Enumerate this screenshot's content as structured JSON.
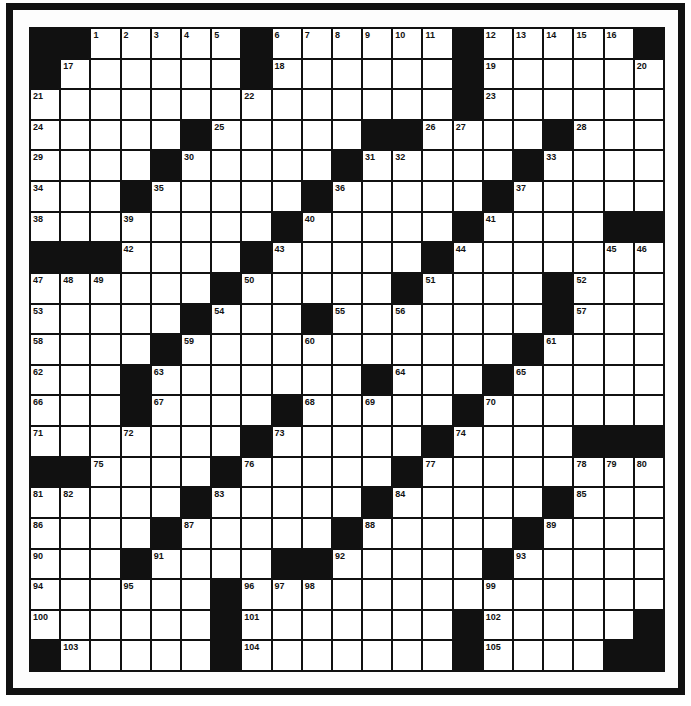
{
  "puzzle": {
    "rows": 21,
    "cols": 21,
    "colors": {
      "black": "#111111",
      "white": "#ffffff",
      "line": "#111111"
    },
    "black_cells": [
      [
        0,
        1,
        7,
        14,
        20
      ],
      [
        0,
        7,
        14
      ],
      [
        14
      ],
      [
        5,
        11,
        12,
        17
      ],
      [
        4,
        10,
        16
      ],
      [
        3,
        9,
        15
      ],
      [
        8,
        14,
        19,
        20
      ],
      [
        0,
        1,
        2,
        7,
        13
      ],
      [
        6,
        12,
        17
      ],
      [
        5,
        9,
        17
      ],
      [
        4,
        16
      ],
      [
        3,
        11,
        15
      ],
      [
        3,
        8,
        14
      ],
      [
        7,
        13,
        18,
        19,
        20
      ],
      [
        0,
        1,
        6,
        12
      ],
      [
        5,
        11,
        17
      ],
      [
        4,
        10,
        16
      ],
      [
        3,
        8,
        9,
        15
      ],
      [
        6
      ],
      [
        6,
        14,
        20
      ],
      [
        0,
        6,
        14,
        19,
        20
      ]
    ],
    "numbers": [
      {
        "r": 0,
        "c": 2,
        "n": "1"
      },
      {
        "r": 0,
        "c": 3,
        "n": "2"
      },
      {
        "r": 0,
        "c": 4,
        "n": "3"
      },
      {
        "r": 0,
        "c": 5,
        "n": "4"
      },
      {
        "r": 0,
        "c": 6,
        "n": "5"
      },
      {
        "r": 0,
        "c": 8,
        "n": "6"
      },
      {
        "r": 0,
        "c": 9,
        "n": "7"
      },
      {
        "r": 0,
        "c": 10,
        "n": "8"
      },
      {
        "r": 0,
        "c": 11,
        "n": "9"
      },
      {
        "r": 0,
        "c": 12,
        "n": "10"
      },
      {
        "r": 0,
        "c": 13,
        "n": "11"
      },
      {
        "r": 0,
        "c": 15,
        "n": "12"
      },
      {
        "r": 0,
        "c": 16,
        "n": "13"
      },
      {
        "r": 0,
        "c": 17,
        "n": "14"
      },
      {
        "r": 0,
        "c": 18,
        "n": "15"
      },
      {
        "r": 0,
        "c": 19,
        "n": "16"
      },
      {
        "r": 1,
        "c": 1,
        "n": "17"
      },
      {
        "r": 1,
        "c": 8,
        "n": "18"
      },
      {
        "r": 1,
        "c": 15,
        "n": "19"
      },
      {
        "r": 1,
        "c": 20,
        "n": "20"
      },
      {
        "r": 2,
        "c": 0,
        "n": "21"
      },
      {
        "r": 2,
        "c": 7,
        "n": "22"
      },
      {
        "r": 2,
        "c": 15,
        "n": "23"
      },
      {
        "r": 3,
        "c": 0,
        "n": "24"
      },
      {
        "r": 3,
        "c": 6,
        "n": "25"
      },
      {
        "r": 3,
        "c": 13,
        "n": "26"
      },
      {
        "r": 3,
        "c": 14,
        "n": "27"
      },
      {
        "r": 3,
        "c": 18,
        "n": "28"
      },
      {
        "r": 4,
        "c": 0,
        "n": "29"
      },
      {
        "r": 4,
        "c": 5,
        "n": "30"
      },
      {
        "r": 4,
        "c": 11,
        "n": "31"
      },
      {
        "r": 4,
        "c": 12,
        "n": "32"
      },
      {
        "r": 4,
        "c": 17,
        "n": "33"
      },
      {
        "r": 5,
        "c": 0,
        "n": "34"
      },
      {
        "r": 5,
        "c": 4,
        "n": "35"
      },
      {
        "r": 5,
        "c": 10,
        "n": "36"
      },
      {
        "r": 5,
        "c": 16,
        "n": "37"
      },
      {
        "r": 6,
        "c": 0,
        "n": "38"
      },
      {
        "r": 6,
        "c": 3,
        "n": "39"
      },
      {
        "r": 6,
        "c": 9,
        "n": "40"
      },
      {
        "r": 6,
        "c": 15,
        "n": "41"
      },
      {
        "r": 7,
        "c": 3,
        "n": "42"
      },
      {
        "r": 7,
        "c": 8,
        "n": "43"
      },
      {
        "r": 7,
        "c": 14,
        "n": "44"
      },
      {
        "r": 7,
        "c": 19,
        "n": "45"
      },
      {
        "r": 7,
        "c": 20,
        "n": "46"
      },
      {
        "r": 8,
        "c": 0,
        "n": "47"
      },
      {
        "r": 8,
        "c": 1,
        "n": "48"
      },
      {
        "r": 8,
        "c": 2,
        "n": "49"
      },
      {
        "r": 8,
        "c": 7,
        "n": "50"
      },
      {
        "r": 8,
        "c": 13,
        "n": "51"
      },
      {
        "r": 8,
        "c": 18,
        "n": "52"
      },
      {
        "r": 9,
        "c": 0,
        "n": "53"
      },
      {
        "r": 9,
        "c": 6,
        "n": "54"
      },
      {
        "r": 9,
        "c": 10,
        "n": "55"
      },
      {
        "r": 9,
        "c": 12,
        "n": "56"
      },
      {
        "r": 9,
        "c": 18,
        "n": "57"
      },
      {
        "r": 10,
        "c": 0,
        "n": "58"
      },
      {
        "r": 10,
        "c": 5,
        "n": "59"
      },
      {
        "r": 10,
        "c": 9,
        "n": "60"
      },
      {
        "r": 10,
        "c": 17,
        "n": "61"
      },
      {
        "r": 11,
        "c": 0,
        "n": "62"
      },
      {
        "r": 11,
        "c": 4,
        "n": "63"
      },
      {
        "r": 11,
        "c": 12,
        "n": "64"
      },
      {
        "r": 11,
        "c": 16,
        "n": "65"
      },
      {
        "r": 12,
        "c": 0,
        "n": "66"
      },
      {
        "r": 12,
        "c": 4,
        "n": "67"
      },
      {
        "r": 12,
        "c": 9,
        "n": "68"
      },
      {
        "r": 12,
        "c": 11,
        "n": "69"
      },
      {
        "r": 12,
        "c": 15,
        "n": "70"
      },
      {
        "r": 13,
        "c": 0,
        "n": "71"
      },
      {
        "r": 13,
        "c": 3,
        "n": "72"
      },
      {
        "r": 13,
        "c": 8,
        "n": "73"
      },
      {
        "r": 13,
        "c": 14,
        "n": "74"
      },
      {
        "r": 14,
        "c": 2,
        "n": "75"
      },
      {
        "r": 14,
        "c": 7,
        "n": "76"
      },
      {
        "r": 14,
        "c": 13,
        "n": "77"
      },
      {
        "r": 14,
        "c": 18,
        "n": "78"
      },
      {
        "r": 14,
        "c": 19,
        "n": "79"
      },
      {
        "r": 14,
        "c": 20,
        "n": "80"
      },
      {
        "r": 15,
        "c": 0,
        "n": "81"
      },
      {
        "r": 15,
        "c": 1,
        "n": "82"
      },
      {
        "r": 15,
        "c": 6,
        "n": "83"
      },
      {
        "r": 15,
        "c": 12,
        "n": "84"
      },
      {
        "r": 15,
        "c": 18,
        "n": "85"
      },
      {
        "r": 16,
        "c": 0,
        "n": "86"
      },
      {
        "r": 16,
        "c": 5,
        "n": "87"
      },
      {
        "r": 16,
        "c": 11,
        "n": "88"
      },
      {
        "r": 16,
        "c": 17,
        "n": "89"
      },
      {
        "r": 17,
        "c": 0,
        "n": "90"
      },
      {
        "r": 17,
        "c": 4,
        "n": "91"
      },
      {
        "r": 17,
        "c": 10,
        "n": "92"
      },
      {
        "r": 17,
        "c": 16,
        "n": "93"
      },
      {
        "r": 18,
        "c": 0,
        "n": "94"
      },
      {
        "r": 18,
        "c": 3,
        "n": "95"
      },
      {
        "r": 18,
        "c": 7,
        "n": "96"
      },
      {
        "r": 18,
        "c": 8,
        "n": "97"
      },
      {
        "r": 18,
        "c": 9,
        "n": "98"
      },
      {
        "r": 18,
        "c": 15,
        "n": "99"
      },
      {
        "r": 19,
        "c": 0,
        "n": "100"
      },
      {
        "r": 19,
        "c": 7,
        "n": "101"
      },
      {
        "r": 19,
        "c": 15,
        "n": "102"
      },
      {
        "r": 20,
        "c": 1,
        "n": "103"
      },
      {
        "r": 20,
        "c": 7,
        "n": "104"
      },
      {
        "r": 20,
        "c": 15,
        "n": "105"
      }
    ]
  }
}
